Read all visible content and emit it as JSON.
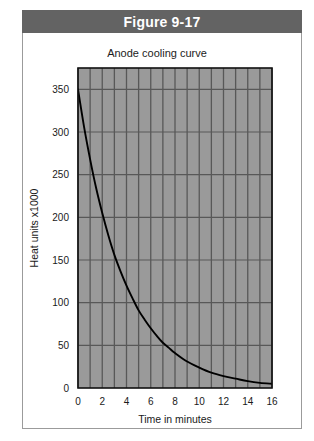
{
  "figure": {
    "banner_label": "Figure 9-17"
  },
  "chart_data": {
    "type": "line",
    "title": "Anode cooling curve",
    "xlabel": "Time in minutes",
    "ylabel": "Heat units x1000",
    "xlim": [
      0,
      16
    ],
    "ylim": [
      0,
      375
    ],
    "xticks": [
      0,
      2,
      4,
      6,
      8,
      10,
      12,
      14,
      16
    ],
    "xtick_labels": [
      "0",
      "2",
      "4",
      "6",
      "8",
      "10",
      "12",
      "14",
      "16"
    ],
    "yticks": [
      0,
      50,
      100,
      150,
      200,
      250,
      300,
      350
    ],
    "ytick_labels": [
      "0",
      "50",
      "100",
      "150",
      "200",
      "250",
      "300",
      "350"
    ],
    "grid": {
      "vertical_step": 1,
      "horizontal_step": 50,
      "background_color": "#9a9a9a",
      "line_color": "#585858"
    },
    "legend": null,
    "series": [
      {
        "name": "Anode cooling",
        "line_color": "#000000",
        "x": [
          0,
          0.5,
          1,
          1.5,
          2,
          2.5,
          3,
          3.5,
          4,
          4.5,
          5,
          5.5,
          6,
          6.5,
          7,
          7.5,
          8,
          9,
          10,
          11,
          12,
          13,
          14,
          15,
          16
        ],
        "values": [
          350,
          306,
          268,
          234,
          205,
          179,
          156,
          137,
          120,
          105,
          91,
          80,
          70,
          61,
          53,
          47,
          41,
          31,
          24,
          18,
          14,
          11,
          8,
          6,
          5
        ]
      }
    ]
  },
  "colors": {
    "banner_background": "#636363",
    "banner_text": "#ffffff",
    "frame_border": "#9b9b9b",
    "plot_background": "#9a9a9a",
    "gridline": "#585858",
    "curve": "#000000",
    "axis": "#111111"
  }
}
